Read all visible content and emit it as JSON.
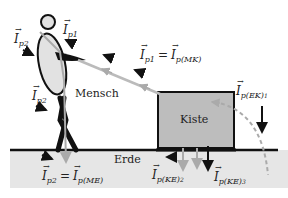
{
  "diagram": {
    "type": "physics-force-diagram",
    "colors": {
      "ground_fill": "#e6e6e6",
      "ground_line": "#111111",
      "box_fill": "#bdbdbd",
      "box_stroke": "#111111",
      "person_fill": "#e2e2e2",
      "person_stroke": "#111111",
      "rope": "#b8b8b8",
      "impulse_arrow_gray": "#aaaaaa",
      "force_arrow_black": "#111111"
    },
    "objects": {
      "person_label": "Mensch",
      "box_label": "Kiste",
      "ground_label": "Erde"
    },
    "impulse_labels": {
      "ip2_top": {
        "symbol": "I",
        "sub": "p2"
      },
      "ip1_top": {
        "symbol": "I",
        "sub": "p1"
      },
      "ip1_eq": {
        "left_sub": "p1",
        "right_sub": "p(MK)"
      },
      "ip2_mid": {
        "symbol": "I",
        "sub": "p2"
      },
      "iek1": {
        "symbol": "I",
        "sub": "p(EK)",
        "subsub": "1"
      },
      "ip2_eq": {
        "left_sub": "p2",
        "right_sub": "p(ME)"
      },
      "ike2": {
        "symbol": "I",
        "sub": "p(KE)",
        "subsub": "2"
      },
      "ike3": {
        "symbol": "I",
        "sub": "p(KE)",
        "subsub": "3"
      }
    },
    "equals_sign": "="
  }
}
